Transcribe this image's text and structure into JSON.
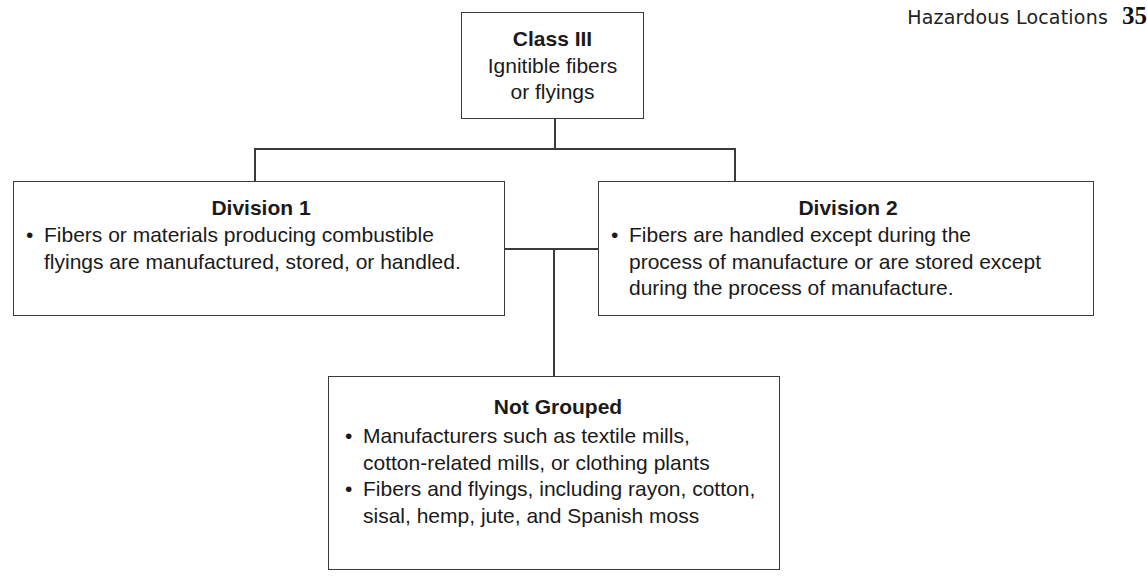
{
  "header": {
    "title": "Hazardous Locations",
    "page_number": "35"
  },
  "diagram": {
    "root": {
      "title": "Class III",
      "subtitle_lines": [
        "Ignitible fibers",
        "or flyings"
      ]
    },
    "division_1": {
      "title": "Division 1",
      "bullets": [
        "Fibers or materials producing combustible flyings are manufactured, stored, or handled."
      ]
    },
    "division_2": {
      "title": "Division 2",
      "bullets": [
        "Fibers are handled except during the process of manufacture or are stored except during the process of manufacture."
      ]
    },
    "not_grouped": {
      "title": "Not Grouped",
      "bullets": [
        "Manufacturers such as textile mills, cotton-related mills, or clothing plants",
        "Fibers and flyings, including rayon, cotton, sisal, hemp, jute, and Spanish moss"
      ]
    }
  },
  "colors": {
    "line": "#3a3a3a",
    "text": "#1a1a1a",
    "background": "#ffffff"
  }
}
